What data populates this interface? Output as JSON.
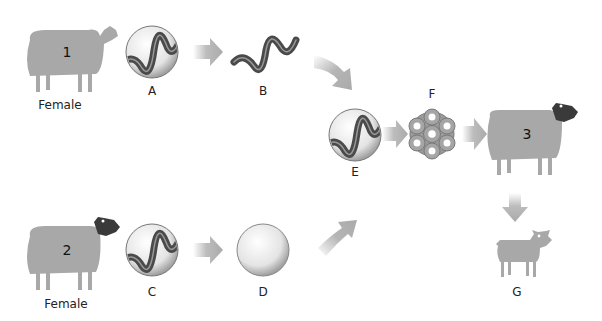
{
  "diagram": {
    "type": "cloning-process",
    "colors": {
      "sheep_body": "#a8a8a8",
      "sheep_dark_head": "#3a3a3a",
      "arrow": "#b5b5b5",
      "dna_strand": "#555555",
      "cell_ring": "#8e8e8e",
      "label_text": "#222222"
    },
    "nodes": {
      "sheep1": {
        "number": "1",
        "caption": "Female",
        "icon": "sheep-white-face-icon"
      },
      "A": {
        "label": "A",
        "icon": "cell-with-dna-icon"
      },
      "B": {
        "label": "B",
        "icon": "dna-helix-icon"
      },
      "sheep2": {
        "number": "2",
        "caption": "Female",
        "icon": "sheep-black-face-icon"
      },
      "C": {
        "label": "C",
        "icon": "cell-with-dna-icon"
      },
      "D": {
        "label": "D",
        "icon": "empty-egg-cell-icon"
      },
      "E": {
        "label": "E",
        "icon": "cell-with-dna-icon"
      },
      "F": {
        "label": "F",
        "icon": "embryo-cluster-icon"
      },
      "sheep3": {
        "number": "3",
        "icon": "sheep-black-face-icon"
      },
      "G": {
        "label": "G",
        "icon": "lamb-icon"
      }
    },
    "edges": [
      {
        "from": "A",
        "to": "B"
      },
      {
        "from": "B",
        "to": "E"
      },
      {
        "from": "C",
        "to": "D"
      },
      {
        "from": "D",
        "to": "E"
      },
      {
        "from": "E",
        "to": "F"
      },
      {
        "from": "F",
        "to": "sheep3"
      },
      {
        "from": "sheep3",
        "to": "G"
      }
    ]
  }
}
